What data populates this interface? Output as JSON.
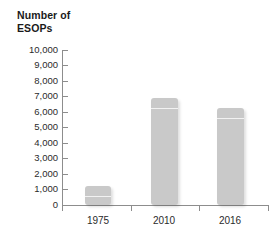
{
  "chart_data": {
    "type": "bar",
    "title": "Number of ESOPs",
    "title_lines": [
      "Number of",
      "ESOPs"
    ],
    "xlabel": "",
    "ylabel": "Number of ESOPs",
    "categories": [
      "1975",
      "2010",
      "2016"
    ],
    "values": [
      1200,
      6900,
      6250
    ],
    "ylim": [
      0,
      10000
    ],
    "ytick_step": 1000,
    "ytick_labels": [
      "10,000",
      "9,000",
      "8,000",
      "7,000",
      "6,000",
      "5,000",
      "4,000",
      "3,000",
      "2,000",
      "1,000",
      "0"
    ],
    "ytick_values": [
      10000,
      9000,
      8000,
      7000,
      6000,
      5000,
      4000,
      3000,
      2000,
      1000,
      0
    ],
    "grid": false,
    "legend": null,
    "legend_position": "none",
    "bar_color": "#c9c9c9",
    "axis_color": "#8d8d8d",
    "text_color": "#2b2b2b",
    "title_color": "#1a1a1a",
    "background_color": "#ffffff",
    "series": [
      {
        "name": "Number of ESOPs",
        "values": [
          1200,
          6900,
          6250
        ]
      }
    ]
  }
}
